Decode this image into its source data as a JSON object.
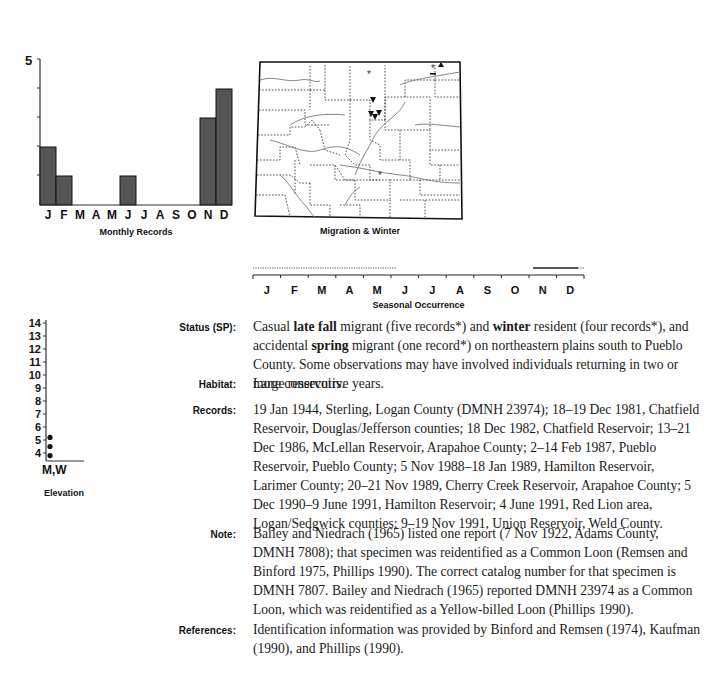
{
  "monthly_chart": {
    "caption": "Monthly Records",
    "y_top_label": "5"
  },
  "map": {
    "caption": "Migration & Winter"
  },
  "seasonal": {
    "caption": "Seasonal Occurrence",
    "months": [
      "J",
      "F",
      "M",
      "A",
      "M",
      "J",
      "J",
      "A",
      "S",
      "O",
      "N",
      "D"
    ]
  },
  "elevation_chart": {
    "caption": "Elevation",
    "x_label": "M,W",
    "ticks": [
      "14",
      "13",
      "12",
      "11",
      "10",
      "9",
      "8",
      "7",
      "6",
      "5",
      "4"
    ]
  },
  "entries": {
    "status": {
      "label": "Status (SP):",
      "parts": {
        "p1": "Casual ",
        "b1": "late fall",
        "p2": " migrant (five records*) and ",
        "b2": "winter",
        "p3": " resident (four records*), and accidental ",
        "b3": "spring",
        "p4": " migrant (one record*) on northeastern plains south to Pueblo County. Some observations may have involved individuals returning in two or more consecutive years."
      }
    },
    "habitat": {
      "label": "Habitat:",
      "text": "Large reservoirs."
    },
    "records": {
      "label": "Records:",
      "text": "19 Jan 1944, Sterling, Logan County (DMNH 23974); 18–19 Dec 1981, Chatfield Reservoir, Douglas/Jefferson counties; 18 Dec 1982, Chatfield Reservoir; 13–21 Dec 1986, McLellan Reservoir, Arapahoe County; 2–14 Feb 1987, Pueblo Reservoir, Pueblo County; 5 Nov 1988–18 Jan 1989, Hamilton Reservoir, Larimer County; 20–21 Nov 1989, Cherry Creek Reservoir, Arapahoe County; 5 Dec 1990–9 June 1991, Hamilton Reservoir; 4 June 1991, Red Lion area, Logan/Sedgwick counties; 9–19 Nov 1991, Union Reservoir, Weld County."
    },
    "note": {
      "label": "Note:",
      "text": "Bailey and Niedrach (1965) listed one report (7 Nov 1922, Adams County, DMNH 7808); that specimen was reidentified as a Common Loon (Remsen and Binford 1975, Phillips 1990). The correct catalog number for that specimen is DMNH 7807. Bailey and Niedrach (1965) reported DMNH 23974 as a Common Loon, which was reidentified as a Yellow-billed Loon (Phillips 1990)."
    },
    "references": {
      "label": "References:",
      "text": "Identification information was provided by Binford and Remsen (1974), Kaufman (1990), and Phillips (1990)."
    }
  },
  "chart_data": [
    {
      "type": "bar",
      "title": "Monthly Records",
      "categories": [
        "J",
        "F",
        "M",
        "A",
        "M",
        "J",
        "J",
        "A",
        "S",
        "O",
        "N",
        "D"
      ],
      "values": [
        2,
        1,
        0,
        0,
        0,
        1,
        0,
        0,
        0,
        0,
        3,
        4
      ],
      "xlabel": "",
      "ylabel": "",
      "ylim": [
        0,
        5
      ],
      "y_ticks": [
        1,
        2,
        3,
        4,
        5
      ],
      "y_tick_labels_shown": [
        "5"
      ],
      "bar_color": "#555555",
      "grid": false
    },
    {
      "type": "scatter",
      "title": "Elevation",
      "categories": [
        "M,W"
      ],
      "x": [
        "M,W",
        "M,W",
        "M,W"
      ],
      "values": [
        3.8,
        4.5,
        5.2
      ],
      "ylim": [
        3.5,
        14
      ],
      "y_ticks": [
        4,
        5,
        6,
        7,
        8,
        9,
        10,
        11,
        12,
        13,
        14
      ],
      "xlabel": "M,W",
      "ylabel": "",
      "grid": false
    },
    {
      "type": "line",
      "title": "Seasonal Occurrence",
      "categories": [
        "J",
        "F",
        "M",
        "A",
        "M",
        "J",
        "J",
        "A",
        "S",
        "O",
        "N",
        "D"
      ],
      "series": [
        {
          "name": "occurrence (dotted, rare)",
          "start": "J",
          "end": "mid-May",
          "style": "dotted"
        },
        {
          "name": "occurrence (solid)",
          "start": "early Nov",
          "end": "late Dec",
          "style": "solid"
        },
        {
          "name": "occurrence (dotted tail)",
          "start": "late Dec",
          "end": "end Dec",
          "style": "dotted"
        }
      ]
    }
  ]
}
